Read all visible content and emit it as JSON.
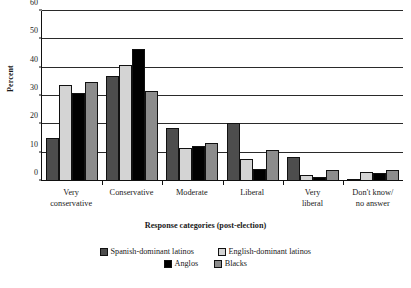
{
  "chart_data": {
    "type": "bar",
    "title": "",
    "xlabel": "Response categories (post-election)",
    "ylabel": "Percent",
    "ylim": [
      0,
      60
    ],
    "yticks": [
      0,
      10,
      20,
      30,
      40,
      50,
      60
    ],
    "grid": true,
    "legend_position": "bottom",
    "categories": [
      "Very conservative",
      "Conservative",
      "Moderate",
      "Liberal",
      "Very liberal",
      "Don't know/ no answer"
    ],
    "category_lines": [
      [
        "Very",
        "conservative"
      ],
      [
        "Conservative",
        ""
      ],
      [
        "Moderate",
        ""
      ],
      [
        "Liberal",
        ""
      ],
      [
        "Very",
        "liberal"
      ],
      [
        "Don't know/",
        "no answer"
      ]
    ],
    "series": [
      {
        "name": "Spanish-dominant latinos",
        "color": "#4d4d4d",
        "values": [
          15.2,
          37.2,
          18.8,
          20.3,
          8.3,
          0.6
        ]
      },
      {
        "name": "English-dominant latinos",
        "color": "#d4d4d4",
        "values": [
          34.0,
          41.0,
          11.5,
          7.6,
          2.1,
          3.3
        ]
      },
      {
        "name": "Anglos",
        "color": "#000000",
        "values": [
          31.2,
          46.6,
          12.4,
          4.2,
          1.5,
          3.0
        ]
      },
      {
        "name": "Blacks",
        "color": "#8c8c8c",
        "values": [
          35.1,
          31.8,
          13.3,
          11.1,
          4.0,
          3.9
        ]
      }
    ]
  }
}
